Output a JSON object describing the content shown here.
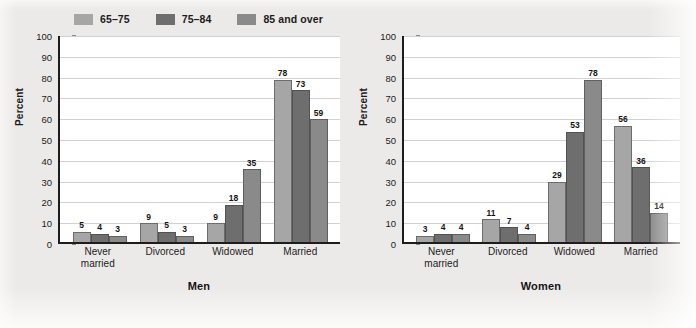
{
  "legend": {
    "items": [
      {
        "label": "65–75",
        "color": "#a6a6a6"
      },
      {
        "label": "75–84",
        "color": "#6e6e6e"
      },
      {
        "label": "85 and over",
        "color": "#8a8a8a"
      }
    ]
  },
  "axis": {
    "ylabel": "Percent",
    "ticks": [
      "100",
      "90",
      "80",
      "70",
      "60",
      "50",
      "40",
      "30",
      "20",
      "10",
      "0"
    ]
  },
  "chart_data": [
    {
      "type": "bar",
      "title": "Men",
      "xlabel": "",
      "ylabel": "Percent",
      "ylim": [
        0,
        100
      ],
      "grid": true,
      "legend_position": "top-left",
      "categories": [
        "Never married",
        "Divorced",
        "Widowed",
        "Married"
      ],
      "series": [
        {
          "name": "65–75",
          "color": "#a6a6a6",
          "values": [
            5,
            9,
            9,
            78
          ]
        },
        {
          "name": "75–84",
          "color": "#6e6e6e",
          "values": [
            4,
            5,
            18,
            73
          ]
        },
        {
          "name": "85 and over",
          "color": "#8a8a8a",
          "values": [
            3,
            3,
            35,
            59
          ]
        }
      ]
    },
    {
      "type": "bar",
      "title": "Women",
      "xlabel": "",
      "ylabel": "Percent",
      "ylim": [
        0,
        100
      ],
      "grid": true,
      "legend_position": "top-left",
      "categories": [
        "Never married",
        "Divorced",
        "Widowed",
        "Married"
      ],
      "series": [
        {
          "name": "65–75",
          "color": "#a6a6a6",
          "values": [
            3,
            11,
            29,
            56
          ]
        },
        {
          "name": "75–84",
          "color": "#6e6e6e",
          "values": [
            4,
            7,
            53,
            36
          ]
        },
        {
          "name": "85 and over",
          "color": "#8a8a8a",
          "values": [
            4,
            4,
            78,
            14
          ]
        }
      ]
    }
  ]
}
